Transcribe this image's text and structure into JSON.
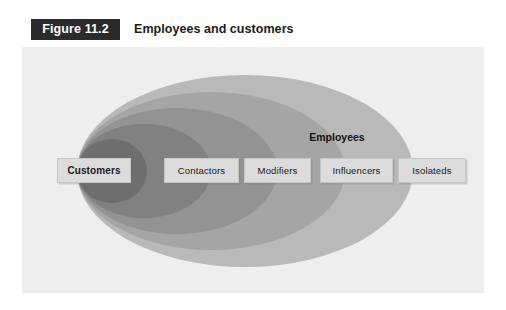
{
  "figure": {
    "number": "Figure 11.2",
    "title": "Employees and customers"
  },
  "diagram": {
    "type": "nested-ellipse-venn",
    "center_label": "Employees",
    "panel_background": "#eeeeee",
    "rings": [
      {
        "name": "Isolateds",
        "level": 5,
        "color": "#b9b9b9"
      },
      {
        "name": "Influencers",
        "level": 4,
        "color": "#a5a5a5"
      },
      {
        "name": "Modifiers",
        "level": 3,
        "color": "#939393"
      },
      {
        "name": "Contactors",
        "level": 2,
        "color": "#818181"
      },
      {
        "name": "Customers",
        "level": 1,
        "color": "#6e6e6e"
      }
    ],
    "categories": [
      {
        "label": "Customers",
        "emphasis": "bold"
      },
      {
        "label": "Contactors",
        "emphasis": "normal"
      },
      {
        "label": "Modifiers",
        "emphasis": "normal"
      },
      {
        "label": "Influencers",
        "emphasis": "normal"
      },
      {
        "label": "Isolateds",
        "emphasis": "normal"
      }
    ]
  }
}
